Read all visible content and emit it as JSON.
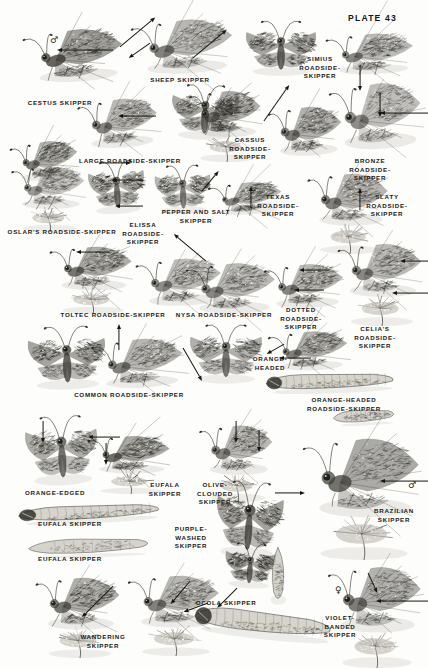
{
  "plate": {
    "title": "PLATE 43",
    "page_background": "#fdfdfb",
    "ink_color": "#17170f",
    "subject": "skippers",
    "symbols": [
      {
        "name": "male-symbol",
        "glyph": "♂",
        "x": 50,
        "y": 36
      },
      {
        "name": "male-symbol",
        "glyph": "♂",
        "x": 408,
        "y": 481
      },
      {
        "name": "female-symbol",
        "glyph": "♀",
        "x": 335,
        "y": 586
      }
    ]
  },
  "labels": [
    {
      "id": "cestus-skipper",
      "text": "CESTUS SKIPPER",
      "x": 60,
      "y": 99,
      "align": "c"
    },
    {
      "id": "sheep-skipper",
      "text": "SHEEP SKIPPER",
      "x": 180,
      "y": 76,
      "align": "c"
    },
    {
      "id": "simius-roadside-skipper",
      "text": "SIMIUS\nROADSIDE-\nSKIPPER",
      "x": 320,
      "y": 55,
      "align": "c"
    },
    {
      "id": "cassus-roadside-skipper",
      "text": "CASSUS\nROADSIDE-\nSKIPPER",
      "x": 250,
      "y": 136,
      "align": "c"
    },
    {
      "id": "bronze-roadside-skipper",
      "text": "BRONZE ROADSIDE-SKIPPER",
      "x": 370,
      "y": 157,
      "align": "c"
    },
    {
      "id": "large-roadside-skipper",
      "text": "LARGE ROADSIDE-SKIPPER",
      "x": 130,
      "y": 157,
      "align": "c"
    },
    {
      "id": "oslars-roadside-skipper",
      "text": "OSLAR'S ROADSIDE-SKIPPER",
      "x": 62,
      "y": 228,
      "align": "c"
    },
    {
      "id": "elissa-roadside-skipper",
      "text": "ELISSA\nROADSIDE-\nSKIPPER",
      "x": 143,
      "y": 221,
      "align": "c"
    },
    {
      "id": "pepper-and-salt-skipper",
      "text": "PEPPER AND SALT\nSKIPPER",
      "x": 196,
      "y": 208,
      "align": "c"
    },
    {
      "id": "texas-roadside-skipper",
      "text": "TEXAS\nROADSIDE-\nSKIPPER",
      "x": 278,
      "y": 193,
      "align": "c"
    },
    {
      "id": "slaty-roadside-skipper",
      "text": "SLATY\nROADSIDE-\nSKIPPER",
      "x": 387,
      "y": 193,
      "align": "c"
    },
    {
      "id": "toltec-roadside-skipper",
      "text": "TOLTEC ROADSIDE-SKIPPER",
      "x": 113,
      "y": 311,
      "align": "c"
    },
    {
      "id": "nysa-roadside-skipper",
      "text": "NYSA ROADSIDE-SKIPPER",
      "x": 224,
      "y": 311,
      "align": "c"
    },
    {
      "id": "dotted-roadside-skipper",
      "text": "DOTTED\nROADSIDE-\nSKIPPER",
      "x": 301,
      "y": 306,
      "align": "c"
    },
    {
      "id": "celias-roadside-skipper",
      "text": "CELIA'S\nROADSIDE-SKIPPER",
      "x": 375,
      "y": 325,
      "align": "c"
    },
    {
      "id": "common-roadside-skipper",
      "text": "COMMON ROADSIDE-SKIPPER",
      "x": 129,
      "y": 391,
      "align": "c"
    },
    {
      "id": "orange-headed",
      "text": "ORANGE-\nHEADED",
      "x": 270,
      "y": 355,
      "align": "c"
    },
    {
      "id": "orange-headed-roadside-skipper",
      "text": "ORANGE-HEADED ROADSIDE-SKIPPER",
      "x": 344,
      "y": 396,
      "align": "c"
    },
    {
      "id": "orange-edged",
      "text": "ORANGE-EDGED",
      "x": 55,
      "y": 489,
      "align": "c"
    },
    {
      "id": "eufala-skipper-upper",
      "text": "EUFALA\nSKIPPER",
      "x": 165,
      "y": 481,
      "align": "c"
    },
    {
      "id": "olive-clouded-skipper",
      "text": "OLIVE-\nCLOUDED\nSKIPPER",
      "x": 215,
      "y": 481,
      "align": "c"
    },
    {
      "id": "brazilian-skipper",
      "text": "BRAZILIAN\nSKIPPER",
      "x": 394,
      "y": 507,
      "align": "c"
    },
    {
      "id": "eufala-skipper-larva",
      "text": "EUFALA SKIPPER",
      "x": 70,
      "y": 520,
      "align": "c"
    },
    {
      "id": "purple-washed-skipper",
      "text": "PURPLE-\nWASHED\nSKIPPER",
      "x": 191,
      "y": 525,
      "align": "c"
    },
    {
      "id": "eufala-skipper-pupa",
      "text": "EUFALA SKIPPER",
      "x": 70,
      "y": 555,
      "align": "c"
    },
    {
      "id": "ocola-skipper",
      "text": "OCOLA SKIPPER",
      "x": 226,
      "y": 599,
      "align": "c"
    },
    {
      "id": "violet-banded-skipper",
      "text": "VIOLET-\nBANDED\nSKIPPER",
      "x": 340,
      "y": 614,
      "align": "c"
    },
    {
      "id": "wandering-skipper",
      "text": "WANDERING\nSKIPPER",
      "x": 103,
      "y": 633,
      "align": "c"
    }
  ],
  "pointers": [
    {
      "id": "p-cestus",
      "x": 113,
      "y": 47,
      "len": 56,
      "angle": 180
    },
    {
      "id": "p-cestus-up",
      "x": 120,
      "y": 44,
      "len": 46,
      "angle": -40
    },
    {
      "id": "p-sheep",
      "x": 193,
      "y": 55,
      "len": 44,
      "angle": -40
    },
    {
      "id": "p-sheep2",
      "x": 150,
      "y": 40,
      "len": 26,
      "angle": 145
    },
    {
      "id": "p-simius",
      "x": 360,
      "y": 62,
      "len": 26,
      "angle": 90
    },
    {
      "id": "p-cassus",
      "x": 264,
      "y": 118,
      "len": 44,
      "angle": -55
    },
    {
      "id": "p-bronze",
      "x": 380,
      "y": 90,
      "len": 24,
      "angle": 90
    },
    {
      "id": "p-bronze2",
      "x": 428,
      "y": 110,
      "len": 48,
      "angle": 180
    },
    {
      "id": "p-large",
      "x": 156,
      "y": 113,
      "len": 38,
      "angle": 180
    },
    {
      "id": "p-large2",
      "x": 101,
      "y": 160,
      "len": 30,
      "angle": 0
    },
    {
      "id": "p-elissa",
      "x": 143,
      "y": 177,
      "len": 32,
      "angle": 180
    },
    {
      "id": "p-elissa2",
      "x": 143,
      "y": 203,
      "len": 28,
      "angle": 180
    },
    {
      "id": "p-pepper",
      "x": 202,
      "y": 188,
      "len": 26,
      "angle": -50
    },
    {
      "id": "p-texas",
      "x": 251,
      "y": 205,
      "len": 22,
      "angle": -90
    },
    {
      "id": "p-slaty",
      "x": 360,
      "y": 207,
      "len": 22,
      "angle": -90
    },
    {
      "id": "p-toltec",
      "x": 110,
      "y": 249,
      "len": 34,
      "angle": 180
    },
    {
      "id": "p-nysa",
      "x": 206,
      "y": 258,
      "len": 42,
      "angle": -140
    },
    {
      "id": "p-dotted",
      "x": 329,
      "y": 267,
      "len": 30,
      "angle": 180
    },
    {
      "id": "p-dotted2",
      "x": 324,
      "y": 287,
      "len": 30,
      "angle": 180
    },
    {
      "id": "p-celias",
      "x": 428,
      "y": 258,
      "len": 28,
      "angle": 180
    },
    {
      "id": "p-celias2",
      "x": 428,
      "y": 290,
      "len": 36,
      "angle": 180
    },
    {
      "id": "p-common",
      "x": 119,
      "y": 347,
      "len": 26,
      "angle": -90
    },
    {
      "id": "p-commonline",
      "x": 183,
      "y": 345,
      "len": 38,
      "angle": 60
    },
    {
      "id": "p-orangehead",
      "x": 311,
      "y": 355,
      "len": 32,
      "angle": 180
    },
    {
      "id": "p-orangehead2",
      "x": 284,
      "y": 341,
      "len": 20,
      "angle": 150
    },
    {
      "id": "p-orangeedged",
      "x": 43,
      "y": 418,
      "len": 22,
      "angle": 90
    },
    {
      "id": "p-orangeedged2",
      "x": 120,
      "y": 434,
      "len": 32,
      "angle": 180
    },
    {
      "id": "p-eufala",
      "x": 106,
      "y": 440,
      "len": 22,
      "angle": 90
    },
    {
      "id": "p-olive",
      "x": 236,
      "y": 418,
      "len": 22,
      "angle": 90
    },
    {
      "id": "p-olive2",
      "x": 259,
      "y": 427,
      "len": 22,
      "angle": 90
    },
    {
      "id": "p-purple",
      "x": 275,
      "y": 490,
      "len": 30,
      "angle": 0
    },
    {
      "id": "p-brazilian",
      "x": 428,
      "y": 478,
      "len": 48,
      "angle": 180
    },
    {
      "id": "p-wandering",
      "x": 113,
      "y": 583,
      "len": 44,
      "angle": 135
    },
    {
      "id": "p-ocola",
      "x": 190,
      "y": 578,
      "len": 30,
      "angle": 130
    },
    {
      "id": "p-ocola2",
      "x": 208,
      "y": 600,
      "len": 26,
      "angle": 160
    },
    {
      "id": "p-purple2",
      "x": 237,
      "y": 585,
      "len": 28,
      "angle": 135
    },
    {
      "id": "p-violet",
      "x": 428,
      "y": 598,
      "len": 52,
      "angle": 180
    },
    {
      "id": "p-violet2",
      "x": 368,
      "y": 570,
      "len": 22,
      "angle": 65
    }
  ],
  "specimens": [
    {
      "id": "cestus-skipper",
      "kind": "butterfly-side",
      "x": 28,
      "y": 22,
      "w": 98,
      "h": 62,
      "rot": -4,
      "tone": 0.8
    },
    {
      "id": "sheep-skipper",
      "kind": "butterfly-side",
      "x": 136,
      "y": 12,
      "w": 100,
      "h": 64,
      "rot": -3,
      "tone": 0.62
    },
    {
      "id": "simius-roadside-skipper",
      "kind": "butterfly-open",
      "x": 242,
      "y": 24,
      "w": 78,
      "h": 54,
      "rot": 0,
      "tone": 0.78
    },
    {
      "id": "simius-roadside-under",
      "kind": "butterfly-side",
      "x": 330,
      "y": 28,
      "w": 86,
      "h": 48,
      "rot": -2,
      "tone": 0.58
    },
    {
      "id": "cassus-roadside-skipper",
      "kind": "butterfly-open",
      "x": 168,
      "y": 88,
      "w": 74,
      "h": 54,
      "rot": 2,
      "tone": 0.76
    },
    {
      "id": "cassus-roadside-perched",
      "kind": "butterfly-flower",
      "x": 188,
      "y": 86,
      "w": 78,
      "h": 76,
      "rot": 0,
      "tone": 0.7
    },
    {
      "id": "large-roadside-skipper",
      "kind": "butterfly-side",
      "x": 82,
      "y": 92,
      "w": 78,
      "h": 58,
      "rot": -4,
      "tone": 0.6
    },
    {
      "id": "bronze-roadside-open",
      "kind": "butterfly-side",
      "x": 272,
      "y": 100,
      "w": 72,
      "h": 58,
      "rot": -2,
      "tone": 0.66
    },
    {
      "id": "bronze-roadside-side",
      "kind": "butterfly-side",
      "x": 334,
      "y": 74,
      "w": 90,
      "h": 78,
      "rot": -3,
      "tone": 0.55
    },
    {
      "id": "oslars-roadside-skipper",
      "kind": "butterfly-flower",
      "x": 10,
      "y": 162,
      "w": 80,
      "h": 70,
      "rot": 0,
      "tone": 0.48
    },
    {
      "id": "large-roadside-under",
      "kind": "butterfly-side",
      "x": 14,
      "y": 136,
      "w": 66,
      "h": 46,
      "rot": -5,
      "tone": 0.66
    },
    {
      "id": "elissa-roadside-skipper",
      "kind": "butterfly-open",
      "x": 86,
      "y": 164,
      "w": 62,
      "h": 52,
      "rot": -4,
      "tone": 0.72
    },
    {
      "id": "pepper-and-salt-skipper",
      "kind": "butterfly-open",
      "x": 152,
      "y": 168,
      "w": 62,
      "h": 48,
      "rot": -2,
      "tone": 0.64
    },
    {
      "id": "texas-roadside-skipper",
      "kind": "butterfly-side",
      "x": 212,
      "y": 178,
      "w": 72,
      "h": 38,
      "rot": -3,
      "tone": 0.6
    },
    {
      "id": "slaty-roadside-skipper",
      "kind": "butterfly-flower",
      "x": 306,
      "y": 168,
      "w": 88,
      "h": 86,
      "rot": 0,
      "tone": 0.62
    },
    {
      "id": "toltec-roadside-skipper",
      "kind": "butterfly-flower",
      "x": 48,
      "y": 242,
      "w": 90,
      "h": 72,
      "rot": 0,
      "tone": 0.7
    },
    {
      "id": "toltec-roadside-side",
      "kind": "butterfly-side",
      "x": 140,
      "y": 252,
      "w": 84,
      "h": 56,
      "rot": -2,
      "tone": 0.56
    },
    {
      "id": "nysa-roadside-skipper",
      "kind": "butterfly-side",
      "x": 190,
      "y": 256,
      "w": 88,
      "h": 60,
      "rot": -1,
      "tone": 0.58
    },
    {
      "id": "dotted-roadside-skipper",
      "kind": "butterfly-side",
      "x": 268,
      "y": 258,
      "w": 78,
      "h": 52,
      "rot": -2,
      "tone": 0.6
    },
    {
      "id": "celias-roadside-skipper",
      "kind": "butterfly-flower",
      "x": 336,
      "y": 238,
      "w": 92,
      "h": 88,
      "rot": 0,
      "tone": 0.58
    },
    {
      "id": "common-roadside-skipper",
      "kind": "butterfly-open",
      "x": 24,
      "y": 330,
      "w": 86,
      "h": 62,
      "rot": -2,
      "tone": 0.8
    },
    {
      "id": "common-roadside-side",
      "kind": "butterfly-side",
      "x": 96,
      "y": 332,
      "w": 90,
      "h": 58,
      "rot": -3,
      "tone": 0.62
    },
    {
      "id": "orange-headed-open",
      "kind": "butterfly-open",
      "x": 186,
      "y": 328,
      "w": 80,
      "h": 58,
      "rot": 0,
      "tone": 0.7
    },
    {
      "id": "orange-headed-side",
      "kind": "butterfly-side",
      "x": 272,
      "y": 326,
      "w": 78,
      "h": 46,
      "rot": -2,
      "tone": 0.64
    },
    {
      "id": "orange-headed-larva",
      "kind": "larva",
      "x": 262,
      "y": 368,
      "w": 136,
      "h": 26,
      "rot": -2,
      "tone": 0.42
    },
    {
      "id": "orange-headed-pupa",
      "kind": "pupa",
      "x": 332,
      "y": 406,
      "w": 66,
      "h": 20,
      "rot": -3,
      "tone": 0.38
    },
    {
      "id": "orange-edged-open",
      "kind": "butterfly-open",
      "x": 22,
      "y": 420,
      "w": 80,
      "h": 68,
      "rot": -3,
      "tone": 0.72
    },
    {
      "id": "eufala-skipper-side",
      "kind": "butterfly-flower",
      "x": 86,
      "y": 432,
      "w": 90,
      "h": 62,
      "rot": 0,
      "tone": 0.74
    },
    {
      "id": "olive-clouded-skipper",
      "kind": "butterfly-flower",
      "x": 198,
      "y": 420,
      "w": 80,
      "h": 82,
      "rot": 0,
      "tone": 0.6
    },
    {
      "id": "brazilian-skipper",
      "kind": "butterfly-flower",
      "x": 300,
      "y": 430,
      "w": 128,
      "h": 130,
      "rot": 0,
      "tone": 0.72
    },
    {
      "id": "eufala-larva",
      "kind": "larva",
      "x": 14,
      "y": 500,
      "w": 150,
      "h": 24,
      "rot": -3,
      "tone": 0.46
    },
    {
      "id": "eufala-pupa",
      "kind": "pupa",
      "x": 26,
      "y": 534,
      "w": 130,
      "h": 24,
      "rot": -2,
      "tone": 0.44
    },
    {
      "id": "purple-washed-skipper",
      "kind": "butterfly-open",
      "x": 212,
      "y": 486,
      "w": 74,
      "h": 76,
      "rot": 4,
      "tone": 0.82
    },
    {
      "id": "purple-washed-under",
      "kind": "butterfly-open",
      "x": 222,
      "y": 546,
      "w": 56,
      "h": 44,
      "rot": 4,
      "tone": 0.78
    },
    {
      "id": "ocola-pupa",
      "kind": "pupa",
      "x": 268,
      "y": 546,
      "w": 20,
      "h": 60,
      "rot": 0,
      "tone": 0.44
    },
    {
      "id": "violet-banded-skipper",
      "kind": "butterfly-flower",
      "x": 326,
      "y": 560,
      "w": 102,
      "h": 108,
      "rot": 0,
      "tone": 0.66
    },
    {
      "id": "wandering-skipper",
      "kind": "butterfly-flower",
      "x": 34,
      "y": 572,
      "w": 92,
      "h": 86,
      "rot": 0,
      "tone": 0.7
    },
    {
      "id": "ocola-skipper",
      "kind": "butterfly-flower",
      "x": 126,
      "y": 570,
      "w": 100,
      "h": 86,
      "rot": 0,
      "tone": 0.62
    },
    {
      "id": "ocola-larva",
      "kind": "larva",
      "x": 190,
      "y": 604,
      "w": 146,
      "h": 36,
      "rot": 6,
      "tone": 0.48
    }
  ]
}
